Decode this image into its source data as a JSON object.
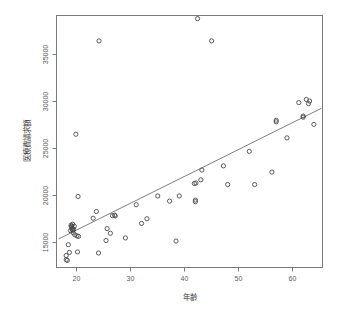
{
  "chart_data": {
    "type": "scatter",
    "title": "",
    "xlabel": "年齢",
    "ylabel": "医療費請求額",
    "xlim": [
      16.2,
      65.6
    ],
    "ylim": [
      13300,
      37600
    ],
    "grid": false,
    "legend": null,
    "xticks": [
      20,
      30,
      40,
      50,
      60
    ],
    "xticklabels": [
      "20",
      "30",
      "40",
      "50",
      "60"
    ],
    "yticks": [
      15000,
      20000,
      25000,
      30000,
      35000
    ],
    "yticklabels": [
      "15000",
      "20000",
      "25000",
      "30000",
      "35000"
    ],
    "marker": "open-circle",
    "series": [
      {
        "name": "observations",
        "x": [
          18.0,
          18.0,
          18.2,
          18.4,
          18.6,
          18.8,
          18.9,
          19.0,
          19.0,
          19.1,
          19.1,
          19.2,
          19.2,
          19.3,
          19.4,
          19.5,
          19.6,
          19.8,
          20.0,
          20.1,
          20.2,
          20.3,
          23.0,
          23.6,
          24.0,
          24.1,
          25.4,
          25.6,
          26.2,
          26.6,
          27.0,
          27.1,
          29.0,
          31.0,
          32.0,
          33.0,
          35.0,
          37.2,
          38.4,
          39.0,
          41.8,
          42.0,
          42.0,
          42.1,
          42.4,
          43.0,
          43.2,
          45.0,
          47.2,
          48.0,
          52.0,
          53.0,
          56.2,
          57.0,
          57.0,
          59.0,
          61.2,
          62.0,
          62.0,
          62.6,
          63.0,
          63.2,
          64.0
        ],
        "y": [
          14050,
          14450,
          13980,
          15500,
          14750,
          16850,
          17380,
          17280,
          17180,
          17080,
          16980,
          16880,
          17480,
          16650,
          16980,
          17280,
          16450,
          26150,
          16350,
          14800,
          20150,
          16300,
          18050,
          18700,
          14700,
          35150,
          15900,
          17050,
          16600,
          18300,
          18350,
          18280,
          16150,
          19350,
          17550,
          18000,
          20200,
          19700,
          15850,
          20200,
          21400,
          19800,
          19650,
          21450,
          37300,
          21750,
          22700,
          35150,
          23100,
          21300,
          24500,
          21300,
          22500,
          27500,
          27350,
          25800,
          29200,
          27900,
          27800,
          29500,
          29100,
          29350,
          27100
        ]
      }
    ],
    "regression_line": {
      "x_start": 16.6,
      "y_start": 16050,
      "x_end": 65.4,
      "y_end": 28650,
      "style": "solid"
    }
  },
  "axes": {
    "x_title": "年齢",
    "y_title": "医療費請求額"
  }
}
